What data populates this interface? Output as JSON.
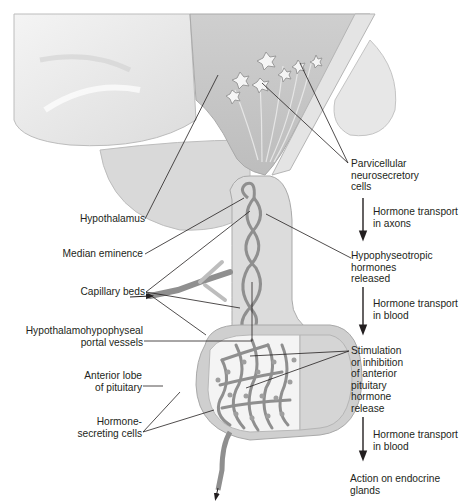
{
  "diagram": {
    "colors": {
      "tissue_light": "#e9e9e9",
      "tissue_mid": "#d2d2d2",
      "tissue_dark": "#bdbdbd",
      "vessel": "#8f8f8f",
      "vessel_outline": "#6e6e6e",
      "text": "#231f20",
      "leader_line": "#231f20"
    }
  },
  "left_labels": {
    "hypothalamus": "Hypothalamus",
    "median_eminence": "Median eminence",
    "capillary_beds": "Capillary beds",
    "portal_vessels": "Hypothalamohypophyseal\nportal vessels",
    "anterior_lobe": "Anterior lobe\nof pituitary",
    "hormone_cells": "Hormone-\nsecreting cells"
  },
  "flow": {
    "steps": [
      "Parvicellular\nneurosecretory\ncells",
      "Hypophyseotropic\nhormones\nreleased",
      "Stimulation\nor inhibition\nof anterior\npituitary\nhormone\nrelease",
      "Action on endocrine\nglands"
    ],
    "transitions": [
      "Hormone transport\nin axons",
      "Hormone transport\nin blood",
      "Hormone transport\nin blood"
    ]
  }
}
